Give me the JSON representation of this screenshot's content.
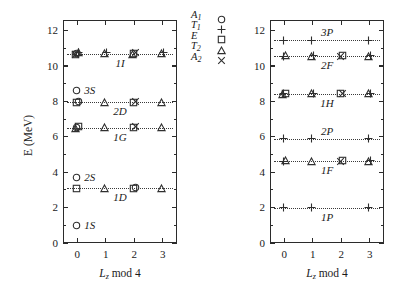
{
  "figure": {
    "axis_y_title": "E (MeV)",
    "axis_x_title_main": "L",
    "axis_x_title_sub": "z",
    "axis_x_title_rest": " mod 4"
  },
  "legend": {
    "position": "between-panels-top",
    "entries": [
      {
        "label": "A",
        "sub": "1",
        "symbol": "circle"
      },
      {
        "label": "T",
        "sub": "1",
        "symbol": "plus"
      },
      {
        "label": "E",
        "sub": "",
        "symbol": "square"
      },
      {
        "label": "T",
        "sub": "2",
        "symbol": "triangle"
      },
      {
        "label": "A",
        "sub": "2",
        "symbol": "cross"
      }
    ]
  },
  "chart_data": {
    "type": "scatter",
    "title": "",
    "xlabel": "Lz mod 4",
    "ylabel": "E (MeV)",
    "xlim": [
      -0.5,
      3.5
    ],
    "ylim": [
      0,
      12.6
    ],
    "x_ticks": [
      "0",
      "1",
      "2",
      "3"
    ],
    "y_ticks": [
      "0",
      "2",
      "4",
      "6",
      "8",
      "10",
      "12"
    ],
    "grid": false,
    "legend_position": "center-top",
    "panels": [
      {
        "name": "left-panel",
        "levels": [
          {
            "label": "1I",
            "energy": 10.7,
            "label_side": "below",
            "points": [
              {
                "x": 0,
                "symbols": [
                  "circle",
                  "plus",
                  "square",
                  "triangle",
                  "cross"
                ]
              },
              {
                "x": 1,
                "symbols": [
                  "triangle",
                  "plus"
                ]
              },
              {
                "x": 2,
                "symbols": [
                  "square",
                  "cross",
                  "triangle"
                ]
              },
              {
                "x": 3,
                "symbols": [
                  "triangle",
                  "plus"
                ]
              }
            ]
          },
          {
            "label": "3S",
            "energy": 8.62,
            "label_side": "right",
            "points": [
              {
                "x": 0,
                "symbols": [
                  "circle"
                ]
              }
            ]
          },
          {
            "label": "2D",
            "energy": 7.95,
            "label_side": "below",
            "points": [
              {
                "x": 0,
                "symbols": [
                  "square",
                  "circle"
                ]
              },
              {
                "x": 1,
                "symbols": [
                  "triangle"
                ]
              },
              {
                "x": 2,
                "symbols": [
                  "square",
                  "cross"
                ]
              },
              {
                "x": 3,
                "symbols": [
                  "triangle"
                ]
              }
            ]
          },
          {
            "label": "1G",
            "energy": 6.52,
            "label_side": "below",
            "points": [
              {
                "x": 0,
                "symbols": [
                  "circle",
                  "square",
                  "triangle"
                ]
              },
              {
                "x": 1,
                "symbols": [
                  "triangle"
                ]
              },
              {
                "x": 2,
                "symbols": [
                  "square",
                  "cross"
                ]
              },
              {
                "x": 3,
                "symbols": [
                  "triangle"
                ]
              }
            ]
          },
          {
            "label": "2S",
            "energy": 3.72,
            "label_side": "right",
            "points": [
              {
                "x": 0,
                "symbols": [
                  "circle"
                ]
              }
            ]
          },
          {
            "label": "1D",
            "energy": 3.1,
            "label_side": "below",
            "points": [
              {
                "x": 0,
                "symbols": [
                  "square"
                ]
              },
              {
                "x": 1,
                "symbols": [
                  "triangle"
                ]
              },
              {
                "x": 2,
                "symbols": [
                  "square",
                  "circle"
                ]
              },
              {
                "x": 3,
                "symbols": [
                  "triangle"
                ]
              }
            ]
          },
          {
            "label": "1S",
            "energy": 1.0,
            "label_side": "right",
            "points": [
              {
                "x": 0,
                "symbols": [
                  "circle"
                ]
              }
            ]
          }
        ]
      },
      {
        "name": "right-panel",
        "levels": [
          {
            "label": "3P",
            "energy": 11.45,
            "label_side": "above",
            "points": [
              {
                "x": 0,
                "symbols": [
                  "plus"
                ]
              },
              {
                "x": 1,
                "symbols": [
                  "plus"
                ]
              },
              {
                "x": 3,
                "symbols": [
                  "plus"
                ]
              }
            ]
          },
          {
            "label": "2F",
            "energy": 10.55,
            "label_side": "below",
            "points": [
              {
                "x": 0,
                "symbols": [
                  "plus",
                  "triangle"
                ]
              },
              {
                "x": 1,
                "symbols": [
                  "triangle",
                  "plus"
                ]
              },
              {
                "x": 2,
                "symbols": [
                  "cross",
                  "square"
                ]
              },
              {
                "x": 3,
                "symbols": [
                  "triangle",
                  "plus"
                ]
              }
            ]
          },
          {
            "label": "1H",
            "energy": 8.42,
            "label_side": "below",
            "points": [
              {
                "x": 0,
                "symbols": [
                  "plus",
                  "square",
                  "triangle"
                ]
              },
              {
                "x": 1,
                "symbols": [
                  "triangle",
                  "plus"
                ]
              },
              {
                "x": 2,
                "symbols": [
                  "square",
                  "cross"
                ]
              },
              {
                "x": 3,
                "symbols": [
                  "triangle",
                  "plus"
                ]
              }
            ]
          },
          {
            "label": "2P",
            "energy": 5.88,
            "label_side": "above",
            "points": [
              {
                "x": 0,
                "symbols": [
                  "plus"
                ]
              },
              {
                "x": 1,
                "symbols": [
                  "plus"
                ]
              },
              {
                "x": 3,
                "symbols": [
                  "plus"
                ]
              }
            ]
          },
          {
            "label": "1F",
            "energy": 4.62,
            "label_side": "below",
            "points": [
              {
                "x": 0,
                "symbols": [
                  "plus",
                  "triangle"
                ]
              },
              {
                "x": 1,
                "symbols": [
                  "triangle"
                ]
              },
              {
                "x": 2,
                "symbols": [
                  "cross",
                  "square"
                ]
              },
              {
                "x": 3,
                "symbols": [
                  "triangle",
                  "plus"
                ]
              }
            ]
          },
          {
            "label": "1P",
            "energy": 1.98,
            "label_side": "below",
            "points": [
              {
                "x": 0,
                "symbols": [
                  "plus"
                ]
              },
              {
                "x": 1,
                "symbols": [
                  "plus"
                ]
              },
              {
                "x": 3,
                "symbols": [
                  "plus"
                ]
              }
            ]
          }
        ]
      }
    ]
  }
}
